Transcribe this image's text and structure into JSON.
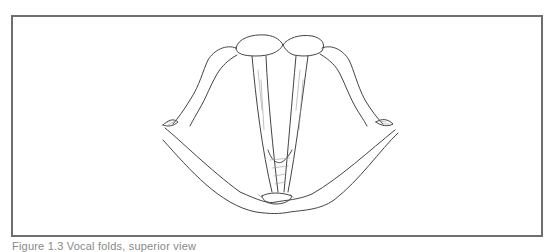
{
  "figure": {
    "type": "line-illustration",
    "frame_color": "#6e6e6e",
    "stroke_color": "#444444"
  },
  "caption": {
    "text": "Figure 1.3  Vocal folds, superior view"
  }
}
